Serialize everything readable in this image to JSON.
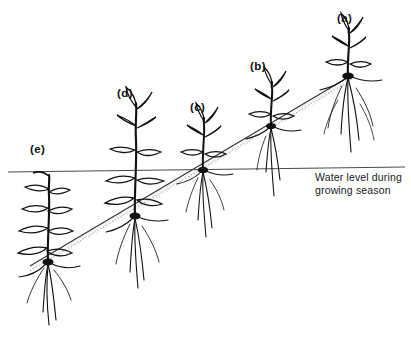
{
  "figure": {
    "background_color": "#ffffff",
    "ink_color": "#111111",
    "width": 411,
    "height": 339
  },
  "annotations": {
    "water_level": {
      "line1": "Water level during",
      "line2": "growing season",
      "x": 315,
      "y1": 181,
      "y2": 194
    }
  },
  "water_line": {
    "name": "water-level-line",
    "x1": 8,
    "y1": 172,
    "x2": 405,
    "y2": 167,
    "color": "#4a4a4a",
    "width": 1.2
  },
  "soil_line": {
    "name": "soil-surface-line",
    "x1": 30,
    "y1": 266,
    "x2": 352,
    "y2": 75,
    "color": "#333333",
    "stipple_color": "#555555",
    "description": "diagonal soil surface with stippled subsurface band"
  },
  "plants": [
    {
      "id": "a",
      "label": "(a)",
      "label_x": 337,
      "label_y": 22,
      "crown_x": 348,
      "crown_y": 76,
      "stem_top_y": 28,
      "root_bottom_y": 152,
      "scale": 1.0,
      "leaf_count": 6,
      "root_count": 9,
      "submerged": false,
      "note": "crown node well above water line; full aerial shoot and dense root mass"
    },
    {
      "id": "b",
      "label": "(b)",
      "label_x": 250,
      "label_y": 70,
      "crown_x": 271,
      "crown_y": 126,
      "stem_top_y": 82,
      "root_bottom_y": 196,
      "scale": 0.88,
      "leaf_count": 6,
      "root_count": 6,
      "submerged": false,
      "note": "crown node above water line, stem passes through the water line"
    },
    {
      "id": "c",
      "label": "(c)",
      "label_x": 190,
      "label_y": 111,
      "crown_x": 203,
      "crown_y": 170,
      "stem_top_y": 118,
      "root_bottom_y": 237,
      "scale": 0.85,
      "leaf_count": 6,
      "root_count": 6,
      "submerged": false,
      "note": "crown node sits exactly at the water line and soil line intersection"
    },
    {
      "id": "d",
      "label": "(d)",
      "label_x": 117,
      "label_y": 97,
      "crown_x": 135,
      "crown_y": 216,
      "stem_top_y": 103,
      "root_bottom_y": 288,
      "scale": 0.95,
      "leaf_count": 8,
      "root_count": 6,
      "submerged": true,
      "note": "crown node below water line; lower leaves submerged, upper shoot emergent"
    },
    {
      "id": "e",
      "label": "(e)",
      "label_x": 30,
      "label_y": 153,
      "crown_x": 48,
      "crown_y": 262,
      "stem_top_y": 175,
      "root_bottom_y": 325,
      "scale": 0.95,
      "leaf_count": 8,
      "root_count": 5,
      "submerged": true,
      "note": "entirely submerged; shoot tip barely reaches the water line"
    }
  ]
}
